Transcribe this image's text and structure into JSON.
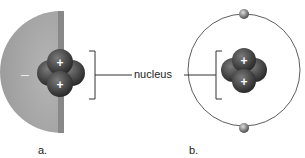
{
  "diagram": {
    "label_center": "nucleus",
    "panel_a": {
      "label": "a.",
      "electron_cloud_sign": "–",
      "proton_sign": "+"
    },
    "panel_b": {
      "label": "b.",
      "proton_sign": "+",
      "electron_sign": "–"
    },
    "colors": {
      "cloud": "#a8a8a8",
      "nucleus_dark": "#3a3a3a",
      "nucleus_mid": "#5a5a5a",
      "orbit": "#333333",
      "bracket": "#333333"
    }
  }
}
